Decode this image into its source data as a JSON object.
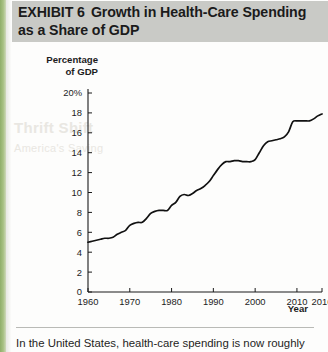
{
  "page": {
    "spine_color": "#a8c184",
    "header_bg": "#c9cac6",
    "watermark_line1": "Thrift Shift",
    "watermark_line2": "America's Saving"
  },
  "header": {
    "exhibit_label": "EXHIBIT 6",
    "title_text": "Growth in Health-Care Spending as a Share of GDP"
  },
  "caption": {
    "text": "In the United States, health-care spending is now roughly"
  },
  "chart_data": {
    "type": "line",
    "title": "Growth in Health-Care Spending as a Share of GDP",
    "xlabel": "Year",
    "ylabel": "Percentage of GDP",
    "xlim": [
      1960,
      2016
    ],
    "ylim": [
      0,
      20
    ],
    "grid": false,
    "legend": false,
    "ytick_labels": [
      "20%",
      "18",
      "16",
      "14",
      "12",
      "10",
      "8",
      "6",
      "4",
      "2",
      "0"
    ],
    "ytick_values": [
      20,
      18,
      16,
      14,
      12,
      10,
      8,
      6,
      4,
      2,
      0
    ],
    "xtick_labels": [
      "1960",
      "1970",
      "1980",
      "1990",
      "2000",
      "2010",
      "2016"
    ],
    "xtick_values": [
      1960,
      1970,
      1980,
      1990,
      2000,
      2010,
      2016
    ],
    "series": [
      {
        "name": "Health-care spending as share of GDP",
        "color": "#111111",
        "x": [
          1960,
          1961,
          1962,
          1963,
          1964,
          1965,
          1966,
          1967,
          1968,
          1969,
          1970,
          1971,
          1972,
          1973,
          1974,
          1975,
          1976,
          1977,
          1978,
          1979,
          1980,
          1981,
          1982,
          1983,
          1984,
          1985,
          1986,
          1987,
          1988,
          1989,
          1990,
          1991,
          1992,
          1993,
          1994,
          1995,
          1996,
          1997,
          1998,
          1999,
          2000,
          2001,
          2002,
          2003,
          2004,
          2005,
          2006,
          2007,
          2008,
          2009,
          2010,
          2011,
          2012,
          2013,
          2014,
          2015,
          2016
        ],
        "values": [
          5.0,
          5.1,
          5.2,
          5.3,
          5.4,
          5.4,
          5.5,
          5.8,
          6.0,
          6.2,
          6.7,
          6.9,
          7.0,
          7.0,
          7.4,
          7.9,
          8.1,
          8.2,
          8.2,
          8.2,
          8.7,
          9.0,
          9.6,
          9.8,
          9.7,
          9.9,
          10.2,
          10.4,
          10.7,
          11.1,
          11.7,
          12.3,
          12.8,
          13.1,
          13.1,
          13.2,
          13.2,
          13.1,
          13.1,
          13.1,
          13.3,
          14.0,
          14.7,
          15.1,
          15.2,
          15.3,
          15.4,
          15.6,
          16.1,
          17.1,
          17.2,
          17.2,
          17.2,
          17.2,
          17.4,
          17.7,
          17.9
        ],
        "start_value": 5.0,
        "end_value": 17.9
      }
    ]
  }
}
